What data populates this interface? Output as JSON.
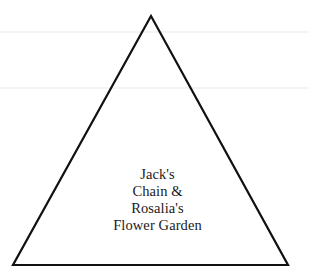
{
  "figure": {
    "width": 309,
    "height": 272,
    "background_color": "#ffffff",
    "alt_description": "Outline of an isosceles triangle containing a four-line centered caption"
  },
  "shape": {
    "name": "triangle",
    "kind": "isosceles-triangle-outline",
    "filled": false,
    "stroke_color": "#111111",
    "stroke_width": 2.2,
    "fill_color": "none",
    "points": "151,16 288,265 13,265",
    "vertices": {
      "apex": {
        "x": 151,
        "y": 16
      },
      "bottom_left": {
        "x": 13,
        "y": 265
      },
      "bottom_right": {
        "x": 288,
        "y": 265
      }
    }
  },
  "artifacts": {
    "color": "#f3f3f5",
    "rules": [
      {
        "name": "upper-scan-rule",
        "y": 31
      },
      {
        "name": "lower-scan-rule",
        "y": 87
      }
    ]
  },
  "label": {
    "align": "center",
    "color": "#1a1a1a",
    "font_size_px": 14.5,
    "line_height_px": 17,
    "lines": [
      "Jack's",
      "Chain &",
      "Rosalia's",
      "Flower Garden"
    ],
    "full_text": "Jack's Chain & Rosalia's Flower Garden"
  }
}
